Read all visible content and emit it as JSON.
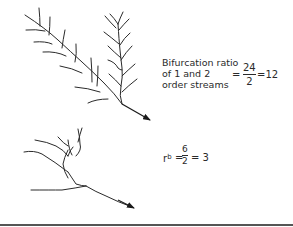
{
  "diagram": {
    "type": "stream-order bifurcation illustration",
    "upper_network": {
      "label_lines": [
        "Bifurcation ratio",
        "of 1 and 2",
        "order streams"
      ],
      "equation": {
        "prefix": "=",
        "numerator": "24",
        "denominator": "2",
        "result": "=12"
      }
    },
    "lower_network": {
      "equation": {
        "symbol": "r",
        "superscript": "b",
        "prefix": "=",
        "numerator": "6",
        "denominator": "2",
        "result": "= 3"
      }
    },
    "colors": {
      "stroke": "#2a2a2a",
      "text": "#2a2a2a",
      "baseline": "#555555",
      "background": "#ffffff"
    }
  }
}
